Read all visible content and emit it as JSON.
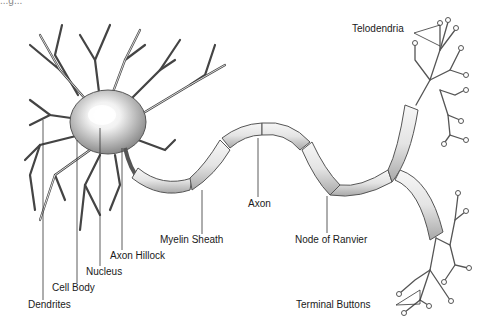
{
  "diagram": {
    "caption_partial": "...g...",
    "labels": {
      "telodendria": "Telodendria",
      "axon": "Axon",
      "myelin_sheath": "Myelin Sheath",
      "node_of_ranvier": "Node of Ranvier",
      "axon_hillock": "Axon Hillock",
      "nucleus": "Nucleus",
      "cell_body": "Cell Body",
      "dendrites": "Dendrites",
      "terminal_buttons": "Terminal Buttons"
    },
    "colors": {
      "background": "#ffffff",
      "line": "#333333",
      "label_text": "#1a1a1a",
      "shading": "#9a9a9a"
    }
  }
}
